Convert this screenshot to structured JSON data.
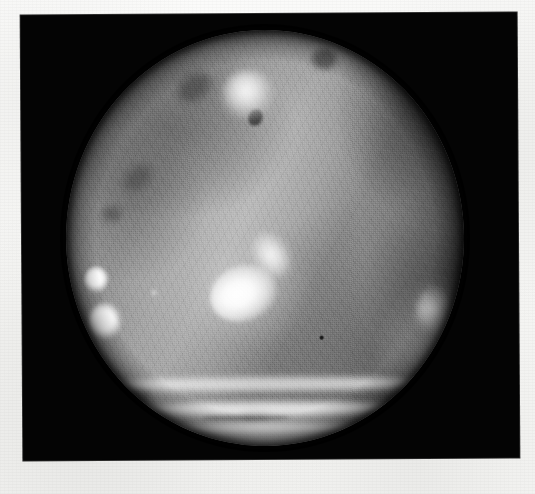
{
  "image": {
    "kind": "medical-photograph",
    "modality": "endoscopic-grayscale-photograph",
    "orientation": "portrait-landscape-plate",
    "caption": "",
    "alt_text": "Grayscale endoscopic photograph showing a circular field of view of mucosal tissue with specular highlights and a dark peripheral rim",
    "has_visible_text": false,
    "colors": {
      "paper": "#f7f7f5",
      "plate_background": "#050505",
      "tissue_midtone": "#8d8d8d",
      "tissue_highlight": "#ffffff",
      "tissue_shadow": "#3a3a3a"
    },
    "geometry": {
      "canvas_width": 535,
      "canvas_height": 494,
      "plate_left": 22,
      "plate_top": 14,
      "plate_width": 496,
      "plate_height": 445,
      "field_center_x": 265,
      "field_center_y": 238,
      "field_radius_x": 199,
      "field_radius_y": 208
    }
  },
  "features": {
    "central_highlight": "bright irregular specular lesion left of centre",
    "upper_highlight": "rounded bright patch upper centre-left",
    "left_edge_highlights": "two small round bright spots on the left rim",
    "bottom_bands": "three bright horizontal specular bands across the lower rim",
    "right_crescent": "dark shadowed crescent along the right periphery",
    "diagonal_fold": "soft bright ridge running from upper centre to lower left",
    "dark_dot": "small dark punctate mark in the lower right quadrant",
    "vascular_texture": "fine dark branching striations across the upper field"
  }
}
